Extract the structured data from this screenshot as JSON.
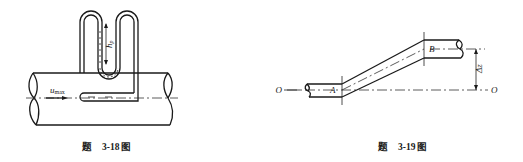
{
  "figures": [
    {
      "id": "fig-3-18",
      "caption": {
        "prefix": "题",
        "number": "3-18",
        "suffix": "图"
      },
      "labels": {
        "velocity": "u",
        "velocity_sub": "max",
        "head": "h",
        "head_sub": "p"
      }
    },
    {
      "id": "fig-3-19",
      "caption": {
        "prefix": "题",
        "number": "3-19",
        "suffix": "图"
      },
      "labels": {
        "point_a": "A",
        "point_b": "B",
        "datum_left": "O",
        "datum_right": "O",
        "elevation": "Δz"
      }
    }
  ]
}
